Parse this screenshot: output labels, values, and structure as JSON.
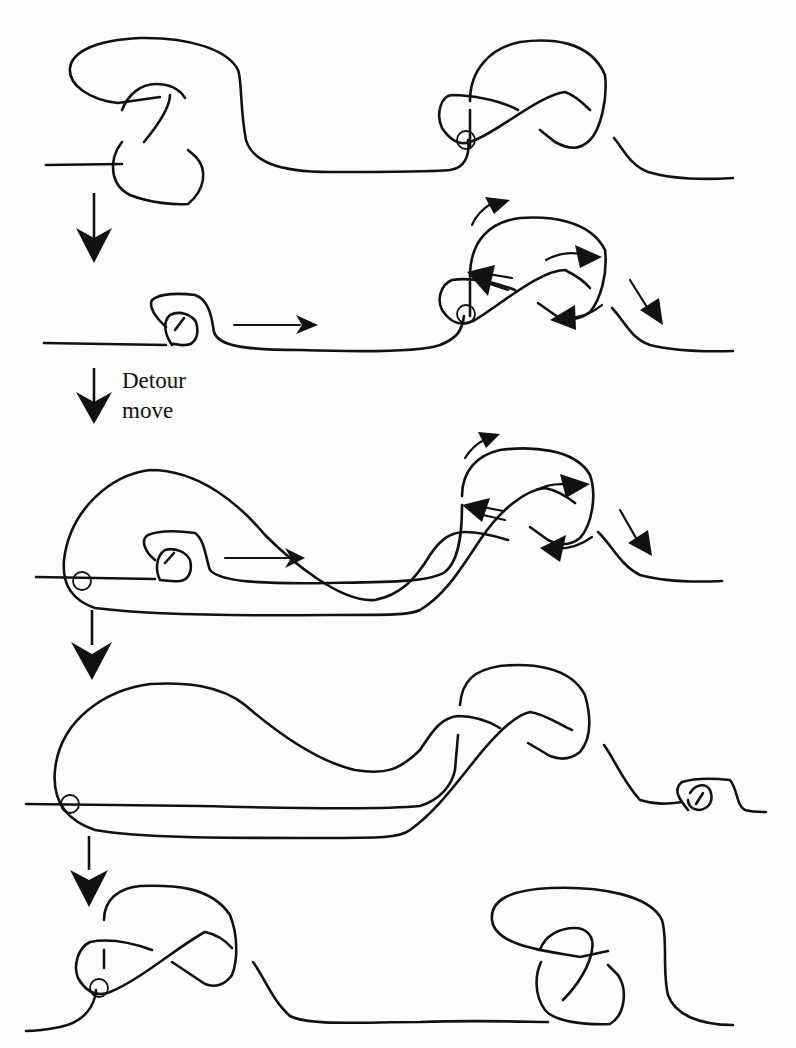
{
  "figure": {
    "type": "knot-diagram-sequence",
    "step_count": 5,
    "transition_label": {
      "line1": "Detour",
      "line2": "move"
    },
    "colors": {
      "stroke": "#111111",
      "background": "#fdfdfd"
    },
    "steps": [
      {
        "index": 1,
        "content": "classical tangle left + virtual crossing tangle right"
      },
      {
        "index": 2,
        "content": "small curl left with motion arrow, oriented tangle right with direction arrows"
      },
      {
        "index": 3,
        "content": "after detour move: strand rerouted around with virtual crossing at far left"
      },
      {
        "index": 4,
        "content": "curl moved to right of tangle"
      },
      {
        "index": 5,
        "content": "virtual tangle left, classical tangle right"
      }
    ]
  }
}
